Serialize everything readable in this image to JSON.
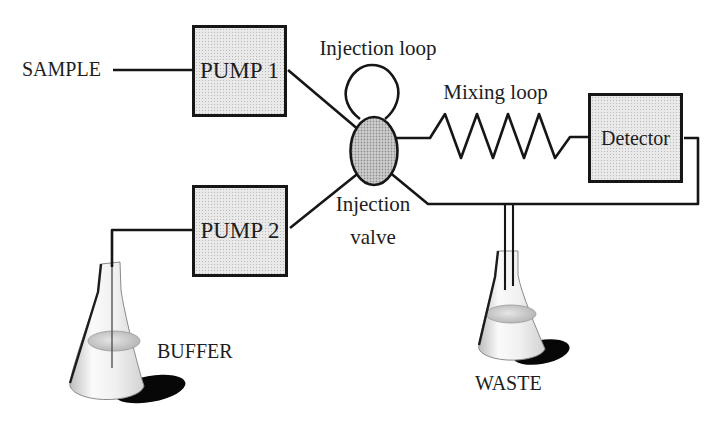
{
  "colors": {
    "background": "#ffffff",
    "line": "#161616",
    "text": "#1d1d1d",
    "box_fill": "#e9e9e9",
    "box_dot": "#b9b9b9",
    "valve_fill": "#d0d0d0",
    "valve_dot": "#8f8f8f",
    "liquid": "#b4b4b4",
    "shadow": "#070707"
  },
  "nodes": {
    "sample": {
      "label": "SAMPLE"
    },
    "pump1": {
      "label": "PUMP 1"
    },
    "pump2": {
      "label": "PUMP 2"
    },
    "injection_loop": {
      "label": "Injection loop"
    },
    "injection_valve": {
      "label_line1": "Injection",
      "label_line2": "valve"
    },
    "mixing_loop": {
      "label": "Mixing loop"
    },
    "detector": {
      "label": "Detector"
    },
    "buffer": {
      "label": "BUFFER"
    },
    "waste": {
      "label": "WASTE"
    }
  }
}
